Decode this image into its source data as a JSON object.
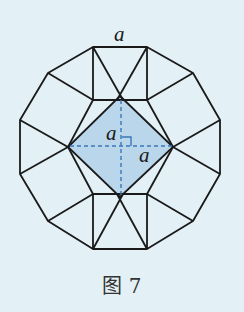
{
  "figure": {
    "caption": "图 7",
    "labels": {
      "top_side": "a",
      "half_diag_vertical": "a",
      "half_diag_horizontal": "a"
    },
    "colors": {
      "background": "#e3f0f5",
      "stroke": "#1a1a1a",
      "shaded_fill": "#b9d6ea",
      "dashed": "#3a78b8"
    }
  }
}
